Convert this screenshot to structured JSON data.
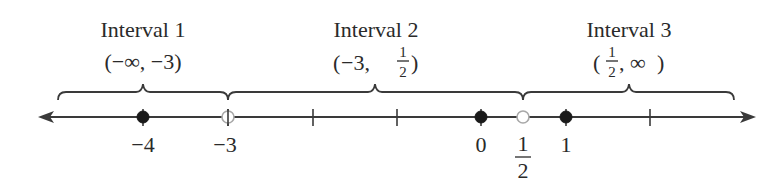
{
  "diagram": {
    "type": "number-line",
    "axis": {
      "min_visible": -5.2,
      "max_visible": 3.2,
      "arrows": "both",
      "unit_px": 84.5,
      "origin_px": 481,
      "y_px": 117
    },
    "ticks": [
      -4,
      -3,
      -2,
      -1,
      0,
      1,
      2
    ],
    "points": [
      {
        "value": -4,
        "label": "−4",
        "style": "filled"
      },
      {
        "value": -3,
        "label": "−3",
        "style": "open"
      },
      {
        "value": 0,
        "label": "0",
        "style": "filled"
      },
      {
        "value": 0.5,
        "label_num": "1",
        "label_den": "2",
        "style": "open"
      },
      {
        "value": 1,
        "label": "1",
        "style": "filled"
      }
    ],
    "intervals": [
      {
        "title": "Interval 1",
        "notation": "(−∞, −3)",
        "open_paren": "(",
        "left": "−∞",
        "sep": ", ",
        "right": "−3",
        "close_paren": ")"
      },
      {
        "title": "Interval 2",
        "notation": "(−3, 1/2)",
        "open_paren": "(",
        "left": "−3,",
        "frac_num": "1",
        "frac_den": "2",
        "close_paren": ")"
      },
      {
        "title": "Interval 3",
        "notation": "(1/2, ∞)",
        "open_paren": "(",
        "frac_num": "1",
        "frac_den": "2",
        "right": ", ∞",
        "close_paren": ")"
      }
    ]
  }
}
